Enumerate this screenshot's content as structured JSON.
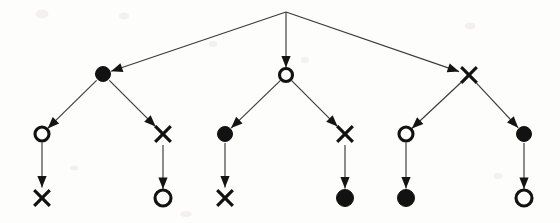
{
  "figure": {
    "title": "",
    "kind": "directed-tree-diagram",
    "background_color": "#fdfdfc",
    "ink_color": "#121212",
    "edge_color": "#3a3a3a",
    "width": 560,
    "height": 223
  },
  "legend": {
    "symbols": [
      {
        "id": "filled-circle",
        "glyph": "filled circle",
        "meaning": "filled-circle-node"
      },
      {
        "id": "hollow-circle",
        "glyph": "open circle",
        "meaning": "hollow-circle-node"
      },
      {
        "id": "cross",
        "glyph": "x",
        "meaning": "cross-node"
      }
    ]
  },
  "nodes": [
    {
      "id": "root",
      "label": "",
      "shape": "apex",
      "x": 286,
      "y": 12,
      "r": 0,
      "level": 0
    },
    {
      "id": "n1",
      "label": "",
      "shape": "filled-circle",
      "x": 103,
      "y": 74,
      "r": 7.5,
      "level": 1
    },
    {
      "id": "n2",
      "label": "",
      "shape": "hollow-circle",
      "x": 286,
      "y": 75,
      "r": 6.5,
      "level": 1
    },
    {
      "id": "n3",
      "label": "",
      "shape": "cross",
      "x": 469,
      "y": 75,
      "r": 9.5,
      "level": 1
    },
    {
      "id": "n1a",
      "label": "",
      "shape": "hollow-circle",
      "x": 42,
      "y": 134,
      "r": 7.0,
      "level": 2
    },
    {
      "id": "n1b",
      "label": "",
      "shape": "cross",
      "x": 163,
      "y": 134,
      "r": 9.5,
      "level": 2
    },
    {
      "id": "n2a",
      "label": "",
      "shape": "filled-circle",
      "x": 225,
      "y": 134,
      "r": 7.5,
      "level": 2
    },
    {
      "id": "n2b",
      "label": "",
      "shape": "cross",
      "x": 345,
      "y": 134,
      "r": 9.5,
      "level": 2
    },
    {
      "id": "n3a",
      "label": "",
      "shape": "hollow-circle",
      "x": 406,
      "y": 134,
      "r": 7.0,
      "level": 2
    },
    {
      "id": "n3b",
      "label": "",
      "shape": "filled-circle",
      "x": 524,
      "y": 134,
      "r": 7.5,
      "level": 2
    },
    {
      "id": "n1a1",
      "label": "",
      "shape": "cross",
      "x": 42,
      "y": 198,
      "r": 9.5,
      "level": 3
    },
    {
      "id": "n1b1",
      "label": "",
      "shape": "hollow-circle",
      "x": 163,
      "y": 198,
      "r": 8.0,
      "level": 3
    },
    {
      "id": "n2a1",
      "label": "",
      "shape": "cross",
      "x": 225,
      "y": 198,
      "r": 9.5,
      "level": 3
    },
    {
      "id": "n2b1",
      "label": "",
      "shape": "filled-circle",
      "x": 345,
      "y": 198,
      "r": 8.5,
      "level": 3
    },
    {
      "id": "n3a1",
      "label": "",
      "shape": "filled-circle",
      "x": 406,
      "y": 198,
      "r": 8.5,
      "level": 3
    },
    {
      "id": "n3b1",
      "label": "",
      "shape": "hollow-circle",
      "x": 524,
      "y": 198,
      "r": 8.0,
      "level": 3
    }
  ],
  "edges": [
    {
      "from": "root",
      "to": "n1",
      "directed": true
    },
    {
      "from": "root",
      "to": "n2",
      "directed": true
    },
    {
      "from": "root",
      "to": "n3",
      "directed": true
    },
    {
      "from": "n1",
      "to": "n1a",
      "directed": true
    },
    {
      "from": "n1",
      "to": "n1b",
      "directed": true
    },
    {
      "from": "n2",
      "to": "n2a",
      "directed": true
    },
    {
      "from": "n2",
      "to": "n2b",
      "directed": true
    },
    {
      "from": "n3",
      "to": "n3a",
      "directed": true
    },
    {
      "from": "n3",
      "to": "n3b",
      "directed": true
    },
    {
      "from": "n1a",
      "to": "n1a1",
      "directed": true
    },
    {
      "from": "n1b",
      "to": "n1b1",
      "directed": true
    },
    {
      "from": "n2a",
      "to": "n2a1",
      "directed": true
    },
    {
      "from": "n2b",
      "to": "n2b1",
      "directed": true
    },
    {
      "from": "n3a",
      "to": "n3a1",
      "directed": true
    },
    {
      "from": "n3b",
      "to": "n3b1",
      "directed": true
    }
  ],
  "speckles": [
    {
      "x": 42,
      "y": 14,
      "w": 13,
      "h": 9
    },
    {
      "x": 124,
      "y": 16,
      "w": 10,
      "h": 7
    },
    {
      "x": 213,
      "y": 44,
      "w": 9,
      "h": 6
    },
    {
      "x": 470,
      "y": 26,
      "w": 11,
      "h": 7
    },
    {
      "x": 305,
      "y": 60,
      "w": 8,
      "h": 6
    },
    {
      "x": 186,
      "y": 214,
      "w": 12,
      "h": 6
    },
    {
      "x": 498,
      "y": 176,
      "w": 9,
      "h": 6
    },
    {
      "x": 74,
      "y": 168,
      "w": 8,
      "h": 5
    }
  ]
}
